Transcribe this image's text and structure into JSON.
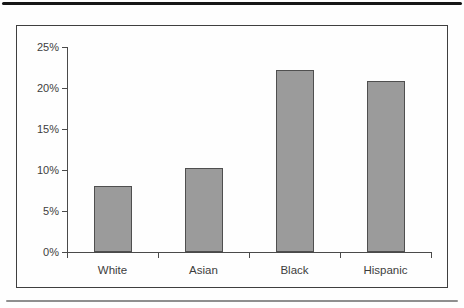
{
  "page": {
    "background": "#fefefe",
    "top_rule_color": "#161616",
    "bottom_rule_color": "#8f8f8f",
    "frame_border_color": "#3f3f3f",
    "axis_color": "#4a4a4a",
    "text_color": "#3d3d3d"
  },
  "chart_data": {
    "type": "bar",
    "categories": [
      "White",
      "Asian",
      "Black",
      "Hispanic"
    ],
    "values": [
      8.1,
      10.2,
      22.2,
      20.9
    ],
    "title": "",
    "xlabel": "",
    "ylabel": "",
    "ylim": [
      0,
      25
    ],
    "ytick_step": 5,
    "ytick_labels": [
      "0%",
      "5%",
      "10%",
      "15%",
      "20%",
      "25%"
    ],
    "grid": false,
    "legend": "none",
    "bar_fill_color": "#9b9b9b",
    "bar_border_color": "#4f4f4f"
  }
}
